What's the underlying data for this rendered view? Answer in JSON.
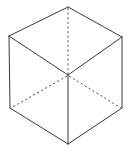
{
  "figure": {
    "type": "line-drawing",
    "shape_name": "cube",
    "projection": "isometric",
    "canvas": {
      "width": 130,
      "height": 154,
      "background": "#ffffff"
    },
    "stroke": {
      "visible_color": "#3a3a3a",
      "hidden_color": "#5a5a5a",
      "width": 1,
      "hidden_dash_pattern": "2.2 2.4"
    },
    "vertices": {
      "top": {
        "label": "top",
        "x": 68,
        "y": 7
      },
      "upper_left": {
        "label": "upper-left",
        "x": 9,
        "y": 36
      },
      "upper_right": {
        "label": "upper-right",
        "x": 122,
        "y": 37
      },
      "center": {
        "label": "center",
        "x": 68,
        "y": 75
      },
      "lower_left": {
        "label": "lower-left",
        "x": 10,
        "y": 108
      },
      "lower_right": {
        "label": "lower-right",
        "x": 122,
        "y": 108
      },
      "bottom": {
        "label": "bottom",
        "x": 68,
        "y": 144
      }
    },
    "edges_visible": [
      {
        "name": "top-left-upper",
        "from": "top",
        "to": "upper_left",
        "d": "M 68 7 L 9 36"
      },
      {
        "name": "top-right-upper",
        "from": "top",
        "to": "upper_right",
        "d": "M 68 7 L 122 37"
      },
      {
        "name": "left-vertical",
        "from": "upper_left",
        "to": "lower_left",
        "d": "M 9 36 L 10 108"
      },
      {
        "name": "right-vertical",
        "from": "upper_right",
        "to": "lower_right",
        "d": "M 122 37 L 122 108"
      },
      {
        "name": "bottom-left-lower",
        "from": "lower_left",
        "to": "bottom",
        "d": "M 10 108 L 68 144"
      },
      {
        "name": "bottom-right-lower",
        "from": "lower_right",
        "to": "bottom",
        "d": "M 122 108 L 68 144"
      },
      {
        "name": "topface-left-diagonal",
        "from": "upper_left",
        "to": "center",
        "d": "M 9 36 L 68 75"
      },
      {
        "name": "topface-right-diagonal",
        "from": "upper_right",
        "to": "center",
        "d": "M 122 37 L 68 75"
      },
      {
        "name": "front-vertical",
        "from": "center",
        "to": "bottom",
        "d": "M 68 75 L 68 144"
      }
    ],
    "edges_hidden": [
      {
        "name": "hidden-vertical",
        "from": "top",
        "to": "center",
        "d": "M 68 8 L 68 74"
      },
      {
        "name": "hidden-diagonal-left",
        "from": "center",
        "to": "lower_left",
        "d": "M 67 76 L 11 108"
      },
      {
        "name": "hidden-diagonal-right",
        "from": "center",
        "to": "lower_right",
        "d": "M 69 76 L 121 108"
      }
    ],
    "faces": [
      {
        "name": "top-face",
        "points": "68,7 9,36 68,75 122,37"
      },
      {
        "name": "left-face",
        "points": "9,36 10,108 68,144 68,75"
      },
      {
        "name": "right-face",
        "points": "122,37 68,75 68,144 122,108"
      }
    ]
  }
}
